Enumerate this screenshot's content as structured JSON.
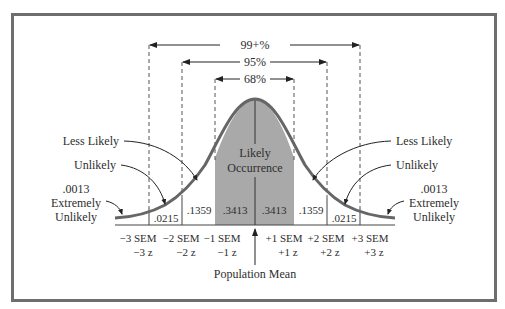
{
  "diagram": {
    "type": "normal-distribution",
    "ranges": [
      {
        "label": "99+%",
        "from_sd": -3,
        "to_sd": 3
      },
      {
        "label": "95%",
        "from_sd": -2,
        "to_sd": 2
      },
      {
        "label": "68%",
        "from_sd": -1,
        "to_sd": 1
      }
    ],
    "center_label": {
      "line1": "Likely",
      "line2": "Occurrence"
    },
    "areas": {
      "left_tail3": ".0215",
      "left_band2": ".1359",
      "left_band1": ".3413",
      "right_band1": ".3413",
      "right_band2": ".1359",
      "right_tail3": ".0215"
    },
    "left_annotations": {
      "less_likely": "Less Likely",
      "unlikely": "Unlikely",
      "extreme_value": ".0013",
      "extreme_line1": "Extremely",
      "extreme_line2": "Unlikely"
    },
    "right_annotations": {
      "less_likely": "Less Likely",
      "unlikely": "Unlikely",
      "extreme_value": ".0013",
      "extreme_line1": "Extremely",
      "extreme_line2": "Unlikely"
    },
    "axis_labels": [
      {
        "sem": "−3 SEM",
        "z": "−3 z"
      },
      {
        "sem": "−2 SEM",
        "z": "−2 z"
      },
      {
        "sem": "−1 SEM",
        "z": "−1 z"
      },
      {
        "sem": "+1 SEM",
        "z": "+1 z"
      },
      {
        "sem": "+2 SEM",
        "z": "+2 z"
      },
      {
        "sem": "+3 SEM",
        "z": "+3 z"
      }
    ],
    "mean_label": "Population Mean",
    "colors": {
      "frame": "#6e6e6e",
      "curve": "#666666",
      "shade": "#a9a9a9",
      "text": "#2e2e2e"
    }
  }
}
